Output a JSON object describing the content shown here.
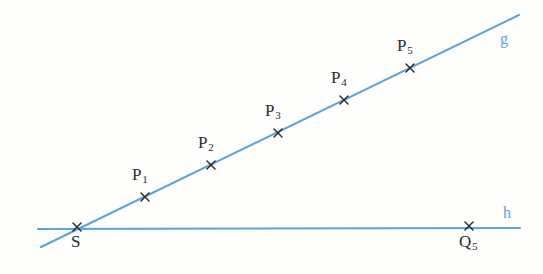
{
  "figure": {
    "background_color": "#fefefc",
    "line_color": "#5ba4da",
    "marker_color": "#2b2b2b",
    "label_color": "#2b2b2b"
  },
  "chart_data": {
    "type": "scatter",
    "title": "",
    "xlabel": "",
    "ylabel": "",
    "grid": false,
    "legend": "none",
    "xlim": [
      0,
      543
    ],
    "ylim": [
      274,
      0
    ],
    "lines": [
      {
        "name": "g",
        "label": "g",
        "label_x": 500,
        "label_y": 31,
        "x1": 41,
        "y1": 247,
        "x2": 519,
        "y2": 15,
        "color": "#5ba4da"
      },
      {
        "name": "h",
        "label": "h",
        "label_x": 503,
        "label_y": 205,
        "x1": 38,
        "y1": 229,
        "x2": 520,
        "y2": 228,
        "color": "#5ba4da"
      }
    ],
    "points": [
      {
        "name": "S",
        "label": "S",
        "sub": "",
        "x": 77,
        "y": 227,
        "label_x": 71,
        "label_y": 233
      },
      {
        "name": "P1",
        "label": "P",
        "sub": "1",
        "x": 145,
        "y": 197,
        "label_x": 132,
        "label_y": 166
      },
      {
        "name": "P2",
        "label": "P",
        "sub": "2",
        "x": 211,
        "y": 165,
        "label_x": 198,
        "label_y": 134
      },
      {
        "name": "P3",
        "label": "P",
        "sub": "3",
        "x": 278,
        "y": 133,
        "label_x": 265,
        "label_y": 102
      },
      {
        "name": "P4",
        "label": "P",
        "sub": "4",
        "x": 344,
        "y": 100,
        "label_x": 331,
        "label_y": 69
      },
      {
        "name": "P5",
        "label": "P",
        "sub": "5",
        "x": 410,
        "y": 68,
        "label_x": 397,
        "label_y": 37
      },
      {
        "name": "Q5",
        "label": "Q",
        "sub": "5",
        "x": 469,
        "y": 226,
        "label_x": 459,
        "label_y": 233
      }
    ],
    "marker_symbol": "x",
    "marker_size": 8
  }
}
